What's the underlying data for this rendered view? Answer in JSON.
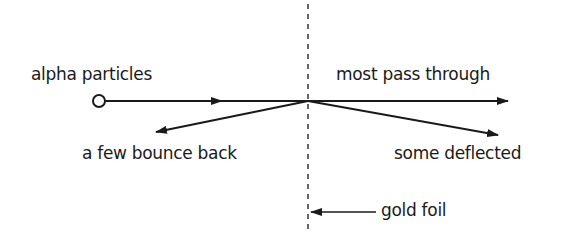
{
  "diagram": {
    "labels": {
      "alpha": "alpha particles",
      "pass": "most pass through",
      "bounce": "a few bounce back",
      "deflected": "some deflected",
      "foil": "gold foil"
    },
    "colors": {
      "stroke": "#1a1a1a",
      "background": "#ffffff"
    }
  }
}
